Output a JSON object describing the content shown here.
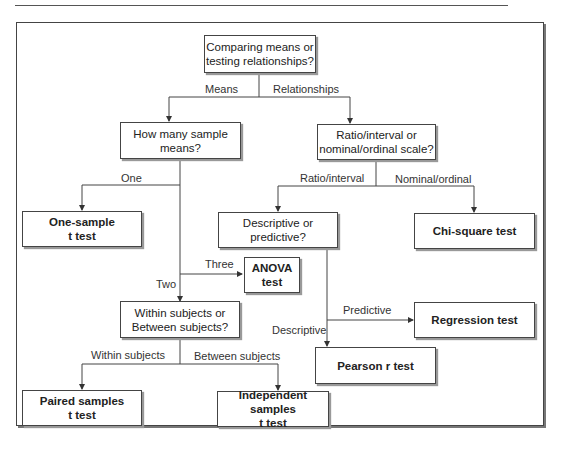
{
  "diagram": {
    "type": "flowchart",
    "nodes": {
      "root": "Comparing means or\ntesting relationships?",
      "how_many": "How many sample\nmeans?",
      "scale": "Ratio/interval or\nnominal/ordinal scale?",
      "one_sample": "One-sample\nt test",
      "desc_pred": "Descriptive or\npredictive?",
      "chi_square": "Chi-square test",
      "anova": "ANOVA\ntest",
      "within_between": "Within subjects or\nBetween subjects?",
      "regression": "Regression test",
      "pearson": "Pearson r test",
      "paired": "Paired samples\nt  test",
      "independent": "Independent samples\nt  test"
    },
    "edge_labels": {
      "means": "Means",
      "relationships": "Relationships",
      "one": "One",
      "two": "Two",
      "three": "Three",
      "ratio_interval": "Ratio/interval",
      "nominal_ordinal": "Nominal/ordinal",
      "predictive": "Predictive",
      "descriptive": "Descriptive",
      "within_subjects": "Within subjects",
      "between_subjects": "Between subjects"
    }
  }
}
